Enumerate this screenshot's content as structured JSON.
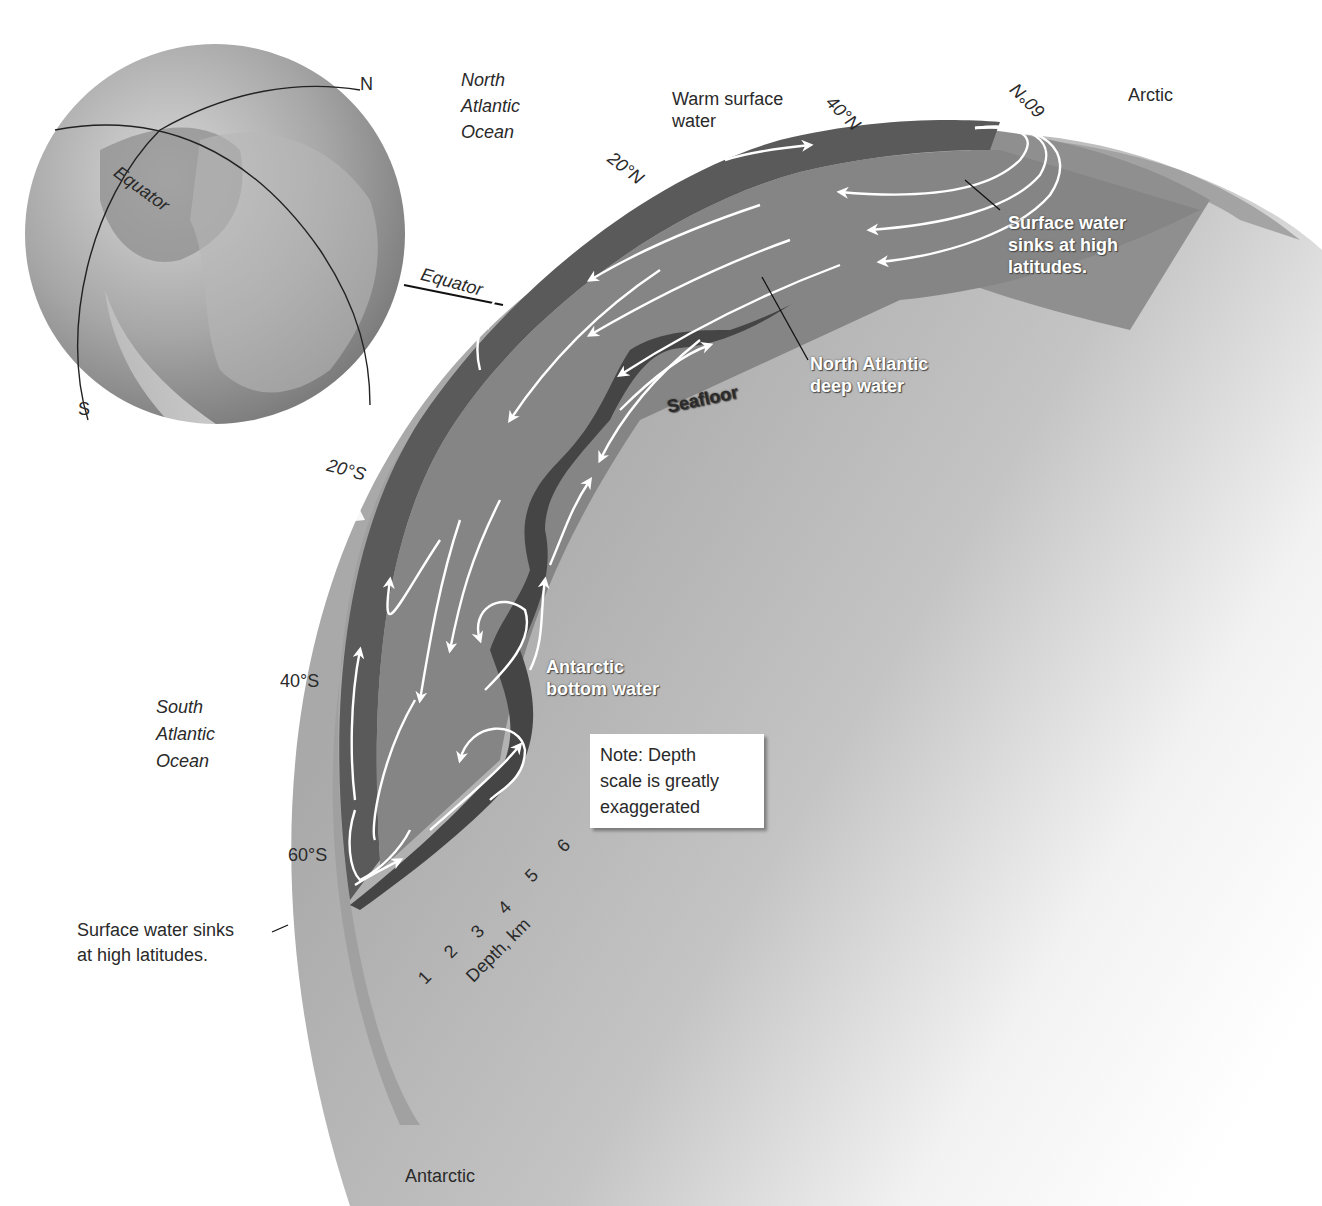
{
  "diagram": {
    "colors": {
      "background": "#ffffff",
      "earth_light": "#c9c9c9",
      "ocean_band": "#9a9a9a",
      "deep_water": "#8a8a8a",
      "surface_water": "#5f5f5f",
      "seafloor": "#4a4a4a",
      "arrows": "#ffffff",
      "text": "#2a2a2a"
    },
    "globe": {
      "labels": {
        "north": "N",
        "south": "S",
        "equator": "Equator"
      }
    },
    "regions": {
      "north_atlantic": "North Atlantic Ocean",
      "north_atlantic_lines": [
        "North",
        "Atlantic",
        "Ocean"
      ],
      "south_atlantic_lines": [
        "South",
        "Atlantic",
        "Ocean"
      ],
      "arctic": "Arctic",
      "antarctic": "Antarctic"
    },
    "latitudes": {
      "equator": "Equator",
      "n20": "20°N",
      "n40": "40°N",
      "n60": "60°N",
      "s20": "20°S",
      "s40": "40°S",
      "s60": "60°S"
    },
    "water_labels": {
      "warm_surface_lines": [
        "Warm surface",
        "water"
      ],
      "sinks_north_lines": [
        "Surface water",
        "sinks at high",
        "latitudes."
      ],
      "nadw_lines": [
        "North Atlantic",
        "deep water"
      ],
      "seafloor": "Seafloor",
      "aabw_lines": [
        "Antarctic",
        "bottom water"
      ],
      "sinks_south_lines": [
        "Surface water sinks",
        "at high latitudes."
      ]
    },
    "depth_scale": {
      "label": "Depth, km",
      "ticks": [
        "1",
        "2",
        "3",
        "4",
        "5",
        "6"
      ]
    },
    "note": {
      "lines": [
        "Note: Depth",
        "scale is greatly",
        "exaggerated"
      ]
    }
  }
}
